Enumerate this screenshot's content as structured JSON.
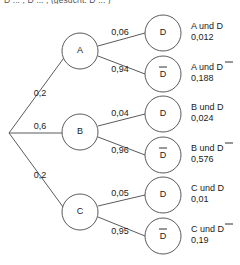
{
  "caption": {
    "fragment": "D ... , D ... , (gesucht: D ... )"
  },
  "diagram": {
    "root": {
      "name": "root-node"
    },
    "level1": [
      {
        "id": "A",
        "label": "A",
        "probability": "0,2"
      },
      {
        "id": "B",
        "label": "B",
        "probability": "0,6"
      },
      {
        "id": "C",
        "label": "C",
        "probability": "0,2"
      }
    ],
    "level2": [
      {
        "id": "A-D",
        "parent": "A",
        "label": "D",
        "bar": false,
        "probability": "0,06",
        "outcome": "A und D",
        "value": "0,012"
      },
      {
        "id": "A-Dbar",
        "parent": "A",
        "label": "D",
        "bar": true,
        "probability": "0,94",
        "outcome": "A und D",
        "value": "0,188"
      },
      {
        "id": "B-D",
        "parent": "B",
        "label": "D",
        "bar": false,
        "probability": "0,04",
        "outcome": "B und D",
        "value": "0,024"
      },
      {
        "id": "B-Dbar",
        "parent": "B",
        "label": "D",
        "bar": true,
        "probability": "0,96",
        "outcome": "B und D",
        "value": "0,576"
      },
      {
        "id": "C-D",
        "parent": "C",
        "label": "D",
        "bar": false,
        "probability": "0,05",
        "outcome": "C und D",
        "value": "0,01"
      },
      {
        "id": "C-Dbar",
        "parent": "C",
        "label": "D",
        "bar": true,
        "probability": "0,95",
        "outcome": "C und D",
        "value": "0,19"
      }
    ],
    "colors": {
      "stroke": "#5a5a5a",
      "text": "#1a1a1a",
      "background": "#ffffff"
    }
  }
}
